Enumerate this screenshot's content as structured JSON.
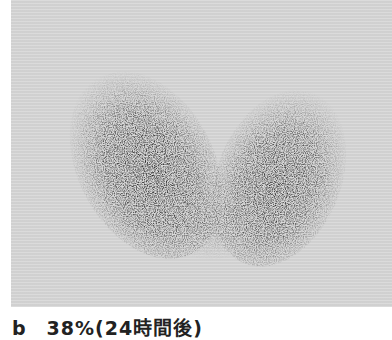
{
  "figure": {
    "type": "thyroid scintigram",
    "background_color": "#d7d7d7",
    "uptake_color": "#1e1e1e"
  },
  "caption": {
    "label": "b",
    "text": "b　38%(24時間後)"
  }
}
